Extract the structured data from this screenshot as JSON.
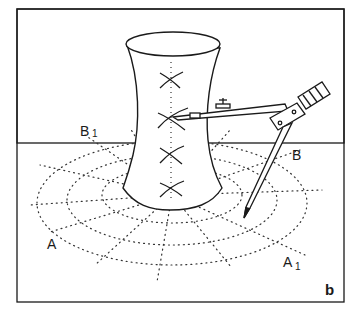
{
  "figure": {
    "panel_label": "b",
    "labels": {
      "A": "A",
      "A1": "A",
      "A1_sub": "1",
      "B": "B",
      "B1": "B",
      "B1_sub": "1"
    },
    "colors": {
      "ink": "#1a1a1a",
      "background": "#ffffff"
    },
    "cross_marks_count": 4
  }
}
